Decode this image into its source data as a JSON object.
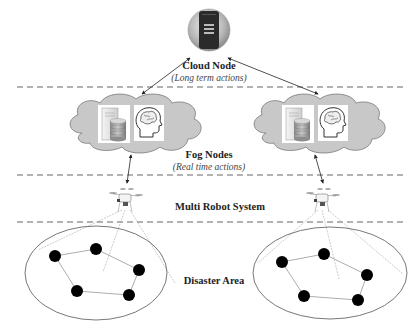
{
  "diagram": {
    "layers": [
      {
        "id": "cloud",
        "title": "Cloud Node",
        "subtitle": "(Long term actions)"
      },
      {
        "id": "fog",
        "title": "Fog Nodes",
        "subtitle": "(Real time actions)"
      },
      {
        "id": "robots",
        "title": "Multi Robot System",
        "subtitle": ""
      },
      {
        "id": "area",
        "title": "Disaster Area",
        "subtitle": ""
      }
    ],
    "icons": {
      "cloud_node": "server-icon",
      "fog_node_components": [
        "server-database-icon",
        "brain-head-icon"
      ],
      "robot": "drone-icon",
      "robot_nodes": "filled-circle"
    },
    "fog_node_count": 2,
    "drone_count": 2,
    "area_count": 2,
    "nodes_per_area": 5,
    "caption": "",
    "colors": {
      "dash_line": "#555555",
      "cloud_fill": "#c8c8c8",
      "cloud_stroke": "#777777",
      "node_fill": "#000000",
      "text": "#222222"
    }
  }
}
